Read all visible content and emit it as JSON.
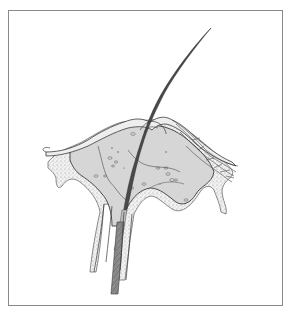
{
  "figure": {
    "colors": {
      "frame": "#8a8a8a",
      "ink": "#3a3a3a",
      "tissue_fill": "#d9d9d9",
      "stipple": "#9a9a9a",
      "shaft_dark": "#7a7a7a",
      "background": "#ffffff"
    },
    "frame": {
      "x": 8,
      "y": 10,
      "width": 275,
      "height": 296
    }
  }
}
